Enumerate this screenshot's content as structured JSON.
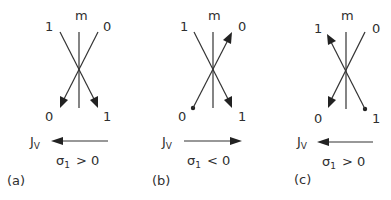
{
  "figure": {
    "panels": [
      {
        "id": "a",
        "caption": "(a)",
        "axis_label": "m",
        "top_left_label": "1",
        "top_right_label": "0",
        "bottom_left_label": "0",
        "bottom_right_label": "1",
        "flux_label": "J",
        "flux_subscript": "V",
        "flux_direction": "left",
        "condition_symbol": "σ",
        "condition_subscript": "1",
        "condition_relation": "> 0",
        "branch_description": "both branches point downward (arrowheads at bottom-left and bottom-right)"
      },
      {
        "id": "b",
        "caption": "(b)",
        "axis_label": "m",
        "top_left_label": "1",
        "top_right_label": "0",
        "bottom_left_label": "0",
        "bottom_right_label": "1",
        "flux_label": "J",
        "flux_subscript": "V",
        "flux_direction": "right",
        "condition_symbol": "σ",
        "condition_subscript": "1",
        "condition_relation": "< 0",
        "branch_description": "dot at bottom-left with arrow to top-right; arrow from top-left to bottom-right"
      },
      {
        "id": "c",
        "caption": "(c)",
        "axis_label": "m",
        "top_left_label": "1",
        "top_right_label": "0",
        "bottom_left_label": "0",
        "bottom_right_label": "1",
        "flux_label": "J",
        "flux_subscript": "V",
        "flux_direction": "left",
        "condition_symbol": "σ",
        "condition_subscript": "1",
        "condition_relation": "> 0",
        "branch_description": "dot at bottom-right with arrow to top-left; arrow from top-right to bottom-left"
      }
    ],
    "colors": {
      "ink": "#2f2f2f",
      "background": "#ffffff"
    }
  }
}
